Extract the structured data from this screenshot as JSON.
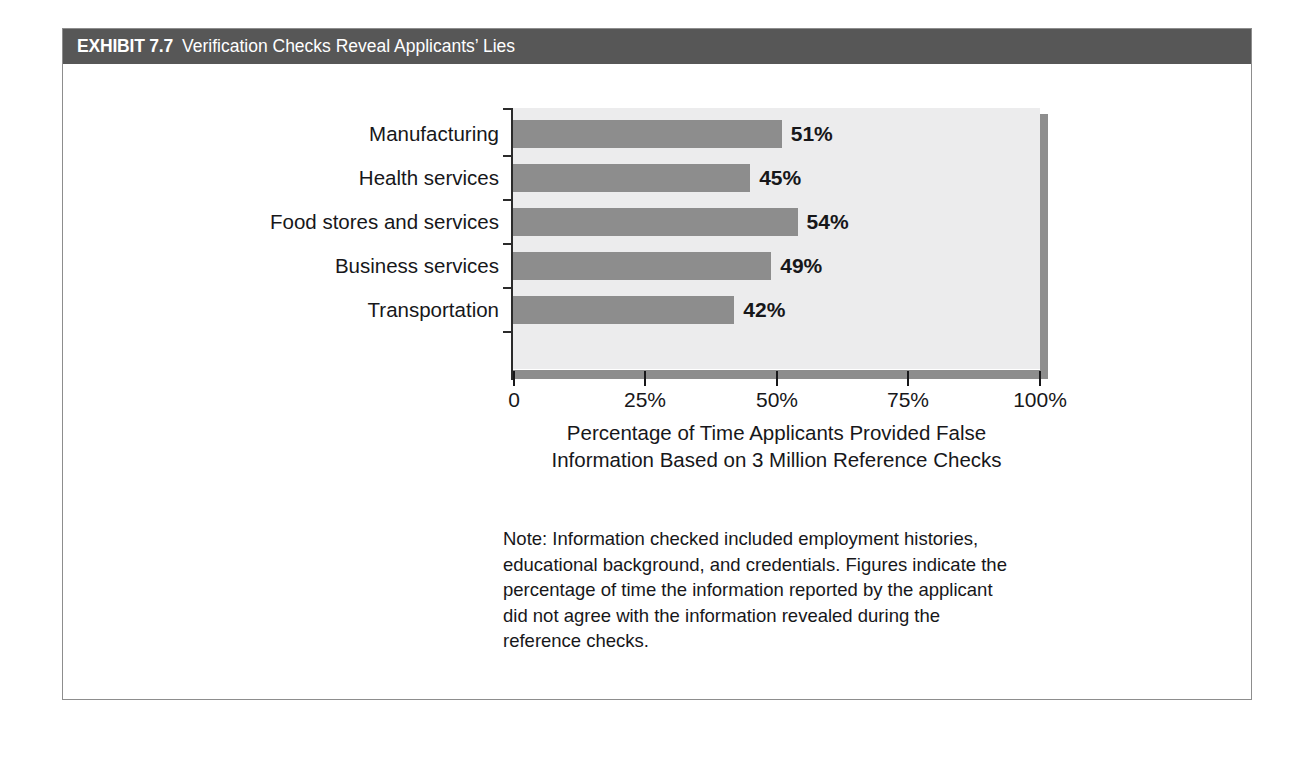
{
  "exhibit": {
    "number": "EXHIBIT 7.7",
    "title": "Verification Checks Reveal Applicants’ Lies",
    "header_bg": "#575757",
    "header_text_color": "#ffffff",
    "border_color": "#8d8d8d"
  },
  "chart_data": {
    "type": "bar",
    "orientation": "horizontal",
    "title": "Verification Checks Reveal Applicants’ Lies",
    "categories": [
      "Manufacturing",
      "Health services",
      "Food stores and services",
      "Business services",
      "Transportation"
    ],
    "values": [
      51,
      45,
      54,
      49,
      42
    ],
    "value_labels": [
      "51%",
      "45%",
      "54%",
      "49%",
      "42%"
    ],
    "xlabel": "Percentage of Time Applicants Provided False Information Based on 3 Million Reference Checks",
    "xlabel_line1": "Percentage of Time Applicants Provided False",
    "xlabel_line2": "Information Based on 3 Million Reference Checks",
    "ylabel": "",
    "xlim": [
      0,
      100
    ],
    "xticks": [
      0,
      25,
      50,
      75,
      100
    ],
    "xtick_labels": [
      "0",
      "25%",
      "50%",
      "75%",
      "100%"
    ],
    "grid": false,
    "legend": false,
    "bar_color": "#8d8d8d",
    "plot_bg": "#ececed",
    "axis_color": "#2b2b2b"
  },
  "note": {
    "text": "Note: Information checked included employment histories, educational background, and credentials. Figures indicate the percentage of time the information reported by the applicant did not agree with the information revealed during the reference checks.",
    "lines": [
      "Note: Information checked included employment histories,",
      "educational background, and credentials. Figures indicate the",
      "percentage of time the information reported by the applicant",
      "did not agree with the information revealed during the",
      "reference checks."
    ]
  }
}
